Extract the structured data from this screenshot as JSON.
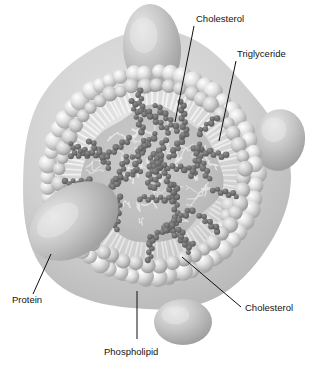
{
  "figure": {
    "background_color": "#ffffff",
    "width": 314,
    "height": 367
  },
  "palette": {
    "background": "#ffffff",
    "core_fill": "#b9b9b9",
    "core_fill_light": "#cccccc",
    "head_light": "#f0f0f0",
    "head_mid": "#d2d2d2",
    "head_dark": "#9a9a9a",
    "tail_stroke": "#f4f4f4",
    "lipid_dark": "#6f6f6f",
    "lipid_darker": "#5a5a5a",
    "protein_fill": "#c2c2c2",
    "protein_light": "#dedede",
    "protein_dark": "#9c9c9c",
    "leader_color": "#101010",
    "label_color": "#141414",
    "squiggle_light": "#efefef"
  },
  "particle": {
    "center_x": 152,
    "center_y": 175,
    "outer_radius_x": 134,
    "outer_radius_y": 140,
    "core_radius_x": 68,
    "core_radius_y": 66,
    "monolayer_thickness": 40,
    "head_count": 54,
    "head_radius": 9.0,
    "tail_count": 96,
    "front_band_rows": 5
  },
  "proteins": [
    {
      "name": "protein-top",
      "cx": 152,
      "cy": 48,
      "rx": 29,
      "ry": 44,
      "rotation": -4
    },
    {
      "name": "protein-left",
      "cx": 74,
      "cy": 221,
      "rx": 49,
      "ry": 34,
      "rotation": -36
    },
    {
      "name": "protein-right",
      "cx": 279,
      "cy": 140,
      "rx": 26,
      "ry": 31,
      "rotation": 10
    },
    {
      "name": "protein-bottom",
      "cx": 183,
      "cy": 322,
      "rx": 29,
      "ry": 23,
      "rotation": 0
    }
  ],
  "callouts": [
    {
      "id": "cholesterol-top",
      "label": "Cholesterol",
      "text_x": 196,
      "text_y": 22,
      "anchor": "start",
      "leader": {
        "x1": 194,
        "y1": 26,
        "x2": 175,
        "y2": 122
      }
    },
    {
      "id": "triglyceride",
      "label": "Triglyceride",
      "text_x": 237,
      "text_y": 57,
      "anchor": "start",
      "leader": {
        "x1": 236,
        "y1": 61,
        "x2": 219,
        "y2": 141
      }
    },
    {
      "id": "protein",
      "label": "Protein",
      "text_x": 12,
      "text_y": 303,
      "anchor": "start",
      "leader": {
        "x1": 51,
        "y1": 254,
        "x2": 33,
        "y2": 294
      }
    },
    {
      "id": "phospholipid",
      "label": "Phospholipid",
      "text_x": 104,
      "text_y": 355,
      "anchor": "start",
      "leader": {
        "x1": 137,
        "y1": 291,
        "x2": 137,
        "y2": 339
      }
    },
    {
      "id": "cholesterol-bottom",
      "label": "Cholesterol",
      "text_x": 245,
      "text_y": 311,
      "anchor": "start",
      "leader": {
        "x1": 182,
        "y1": 257,
        "x2": 241,
        "y2": 307
      }
    }
  ],
  "core_lipids": {
    "description": "Dark beaded zigzag chains representing triglyceride and cholesterol molecules packed in the hydrophobic core",
    "chain_count": 26,
    "bead_radius": 2.9,
    "beads_per_chain": 9
  },
  "membrane_lipids": {
    "description": "Dark beaded chains embedded within the phospholipid monolayer representing cholesterol",
    "chain_count": 9,
    "bead_radius": 2.8,
    "beads_per_chain": 7
  }
}
